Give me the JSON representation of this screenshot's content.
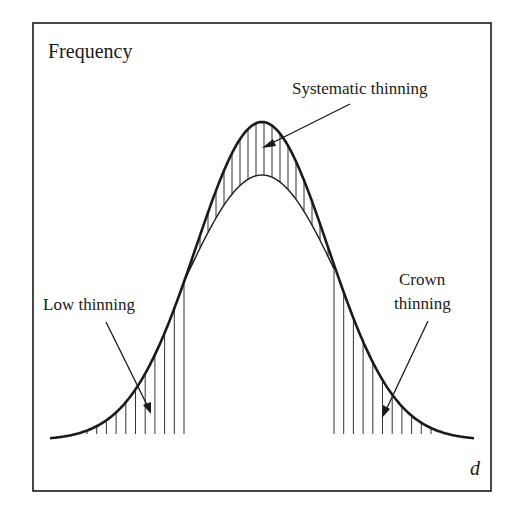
{
  "figure": {
    "y_axis_label": "Frequency",
    "x_axis_label": "d",
    "annotations": {
      "systematic": "Systematic thinning",
      "low": "Low thinning",
      "crown_line1": "Crown",
      "crown_line2": "thinning"
    },
    "colors": {
      "ink": "#1a1a1a",
      "hatch": "#333333",
      "background": "#ffffff"
    }
  },
  "chart_data": {
    "type": "area",
    "title": "",
    "xlabel": "d",
    "ylabel": "Frequency",
    "series": [
      {
        "name": "Original diameter distribution",
        "shape": "bell curve (normal)"
      },
      {
        "name": "Residual after systematic thinning",
        "shape": "scaled-down bell curve"
      }
    ],
    "regions": [
      {
        "name": "Low thinning",
        "description": "hatched area under left tail (small d removed)"
      },
      {
        "name": "Systematic thinning",
        "description": "hatched band between original and reduced curves across the middle"
      },
      {
        "name": "Crown thinning",
        "description": "hatched area under right tail (large d removed)"
      }
    ],
    "grid": false,
    "ticks": false
  }
}
